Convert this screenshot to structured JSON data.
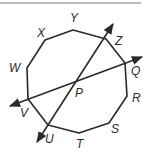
{
  "diagram": {
    "type": "geometry",
    "shape": "decagon",
    "vertices": [
      {
        "label": "Y",
        "x": 73,
        "y": 30,
        "lx": 70,
        "ly": 22
      },
      {
        "label": "Z",
        "x": 106,
        "y": 39,
        "lx": 115,
        "ly": 45
      },
      {
        "label": "Q",
        "x": 125,
        "y": 63,
        "lx": 131,
        "ly": 75
      },
      {
        "label": "R",
        "x": 127,
        "y": 96,
        "lx": 132,
        "ly": 102
      },
      {
        "label": "S",
        "x": 109,
        "y": 123,
        "lx": 111,
        "ly": 133
      },
      {
        "label": "T",
        "x": 79,
        "y": 133,
        "lx": 76,
        "ly": 148
      },
      {
        "label": "U",
        "x": 48,
        "y": 125,
        "lx": 45,
        "ly": 143
      },
      {
        "label": "V",
        "x": 28,
        "y": 99,
        "lx": 20,
        "ly": 117
      },
      {
        "label": "W",
        "x": 27,
        "y": 68,
        "lx": 9,
        "ly": 72
      },
      {
        "label": "X",
        "x": 45,
        "y": 40,
        "lx": 37,
        "ly": 37
      }
    ],
    "intersection": {
      "label": "P",
      "x": 76,
      "y": 83,
      "lx": 75,
      "ly": 97
    },
    "lines": [
      {
        "name": "line-ZU",
        "x1": 113,
        "y1": 24,
        "x2": 37,
        "y2": 142
      },
      {
        "name": "line-QV",
        "x1": 142,
        "y1": 57,
        "x2": 10,
        "y2": 106
      }
    ],
    "top_rule": {
      "x1": 0,
      "x2": 141,
      "y": 3
    },
    "stroke_color": "#2a2a2a"
  }
}
